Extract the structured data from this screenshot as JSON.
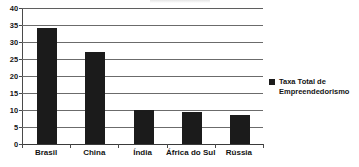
{
  "chart_data": {
    "type": "bar",
    "title": "",
    "xlabel": "",
    "ylabel": "",
    "categories": [
      "Brasil",
      "China",
      "Índia",
      "África do Sul",
      "Rússia"
    ],
    "values": [
      34,
      27,
      10,
      9.5,
      8.5
    ],
    "series": [
      {
        "name": "Taxa Total de Empreendedorismo",
        "values": [
          34,
          27,
          10,
          9.5,
          8.5
        ]
      }
    ],
    "ylim": [
      0,
      40
    ],
    "ytick_labels": [
      "40",
      "35",
      "30",
      "25",
      "20",
      "15",
      "10",
      "5",
      "0"
    ],
    "ytick_values": [
      40,
      35,
      30,
      25,
      20,
      15,
      10,
      5,
      0
    ],
    "grid": "horizontal",
    "legend_position": "right",
    "legend_entries": [
      "Taxa Total de Empreendedorismo"
    ],
    "bar_color": "#1b1b1b",
    "gridline_color": "#6b6b6b",
    "background_color": "#ffffff",
    "annotations": []
  },
  "legend": {
    "swatch_name": "legend-color-swatch",
    "label": "Taxa Total de Empreendedorismo"
  }
}
